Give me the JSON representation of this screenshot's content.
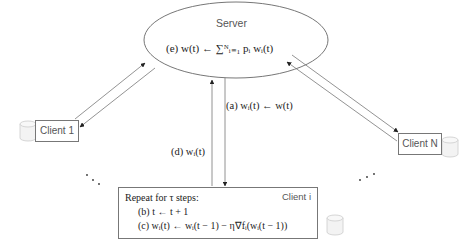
{
  "server": {
    "title": "Server",
    "formula": "(e) w(t) ← ∑ᴺᵢ₌₁ pᵢ wᵢ(t)"
  },
  "clients": {
    "client1": {
      "label": "Client 1"
    },
    "clientN": {
      "label": "Client N"
    },
    "clienti": {
      "label": "Client i",
      "loop_title": "Repeat for τ steps:",
      "step_b": "(b)  t ← t + 1",
      "step_c": "(c)  wᵢ(t) ← wᵢ(t − 1) − η∇fᵢ(wᵢ(t − 1))"
    }
  },
  "edges": {
    "a_label": "(a) wᵢ(t) ← w(t)",
    "d_label": "(d) wᵢ(t)"
  },
  "ellipsis": ". . .",
  "colors": {
    "stroke": "#666666",
    "text": "#222222",
    "label_text": "#555555",
    "database_fill": "#f2f2f2",
    "database_stroke": "#cccccc"
  }
}
